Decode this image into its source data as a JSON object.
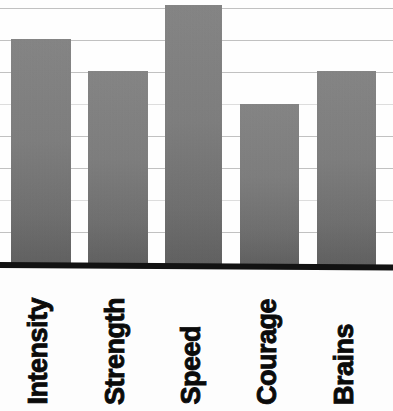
{
  "chart_data": {
    "type": "bar",
    "title": "",
    "subtitle": "",
    "xlabel": "",
    "ylabel": "",
    "categories": [
      "Intensity",
      "Strength",
      "Speed",
      "Courage",
      "Brains"
    ],
    "values": [
      7,
      6,
      8,
      5,
      6
    ],
    "ylim": [
      0,
      8.5
    ],
    "grid": true,
    "gridlines": 8,
    "legend": "none",
    "bar_color": "#7a7a7a",
    "axis_color": "#121212",
    "gridline_color": "#b6b6b6",
    "background_color": "#ffffff",
    "label_color": "#0b0b0b",
    "label_orientation": "vertical-bottom-to-top",
    "bars": [
      {
        "category": "Intensity",
        "value": 7,
        "top_px": 39,
        "left_px": 11,
        "width_px": 60
      },
      {
        "category": "Strength",
        "value": 6,
        "top_px": 71,
        "left_px": 88,
        "width_px": 60
      },
      {
        "category": "Speed",
        "value": 8,
        "top_px": 5,
        "left_px": 165,
        "width_px": 57
      },
      {
        "category": "Courage",
        "value": 5,
        "top_px": 104,
        "left_px": 240,
        "width_px": 59
      },
      {
        "category": "Brains",
        "value": 6,
        "top_px": 71,
        "left_px": 317,
        "width_px": 59
      }
    ],
    "gridline_positions_px": [
      8,
      40,
      72,
      104,
      136,
      168,
      200,
      232
    ],
    "baseline_px": 265
  }
}
